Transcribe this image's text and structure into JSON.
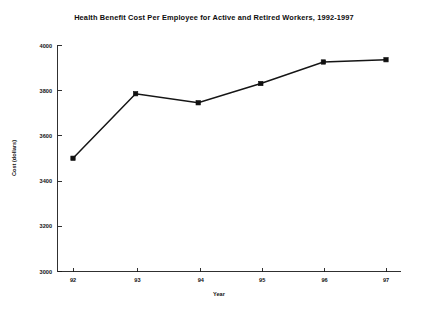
{
  "chart_data": {
    "type": "line",
    "title": "Health Benefit Cost Per Employee for Active and Retired Workers, 1992-1997",
    "xlabel": "Year",
    "ylabel": "Cost (dollars)",
    "categories": [
      "92",
      "93",
      "94",
      "95",
      "96",
      "97"
    ],
    "values": [
      3500,
      3785,
      3745,
      3830,
      3925,
      3935
    ],
    "series": [
      {
        "name": "Health benefit cost per employee",
        "values": [
          3500,
          3785,
          3745,
          3830,
          3925,
          3935
        ]
      }
    ],
    "ylim": [
      3000,
      4000
    ],
    "ytick_labels": [
      "3000",
      "3200",
      "3400",
      "3600",
      "3800",
      "4000"
    ],
    "ytick_values": [
      3000,
      3200,
      3400,
      3600,
      3800,
      4000
    ],
    "xtick_labels": [
      "92",
      "93",
      "94",
      "95",
      "96",
      "97"
    ],
    "grid": false,
    "legend": false,
    "legend_position": "none",
    "marker": "square",
    "line_color": "#151515",
    "marker_color": "#101010",
    "axis_color": "#1a1a1a",
    "background": "#ffffff"
  }
}
